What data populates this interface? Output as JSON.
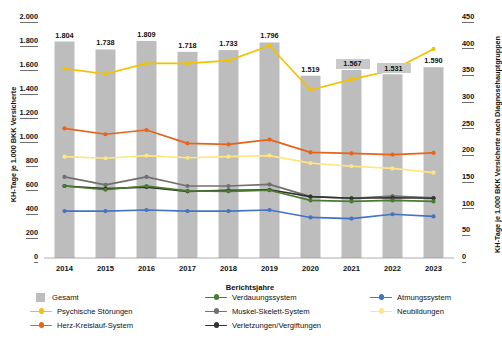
{
  "chart_data": {
    "type": "bar",
    "title": "",
    "xlabel": "Berichtsjahre",
    "ylabel": "KH-Tage je 1.000 BKK Versicherte",
    "ylabel_right": "KH-Tage je 1.000 BKK Versicherte nach Diagnosehauptgruppen",
    "categories": [
      "2014",
      "2015",
      "2016",
      "2017",
      "2018",
      "2019",
      "2020",
      "2021",
      "2022",
      "2023"
    ],
    "ylim": [
      0,
      2000
    ],
    "ylim_right": [
      0,
      450
    ],
    "yticks": [
      "0",
      "200",
      "400",
      "600",
      "800",
      "1.000",
      "1.200",
      "1.400",
      "1.600",
      "1.800",
      "2.000"
    ],
    "yticks_right": [
      "0",
      "50",
      "100",
      "150",
      "200",
      "250",
      "300",
      "350",
      "400",
      "450"
    ],
    "grid": false,
    "legend_position": "bottom",
    "bars": {
      "name": "Gesamt",
      "color": "#bdbdbd",
      "axis": "left",
      "values": [
        1804,
        1738,
        1809,
        1718,
        1733,
        1796,
        1519,
        1567,
        1531,
        1590
      ],
      "labels": [
        "1.804",
        "1.738",
        "1.809",
        "1.718",
        "1.733",
        "1.796",
        "1.519",
        "1.567",
        "1.531",
        "1.590"
      ]
    },
    "series": [
      {
        "name": "Psychische Störungen",
        "color": "#f2c200",
        "axis": "right",
        "values": [
          355,
          345,
          365,
          365,
          370,
          398,
          315,
          335,
          352,
          392
        ]
      },
      {
        "name": "Herz-Kreislauf-System",
        "color": "#e8631a",
        "axis": "right",
        "values": [
          243,
          232,
          240,
          215,
          213,
          222,
          198,
          196,
          194,
          197
        ]
      },
      {
        "name": "Neubildungen",
        "color": "#ffe680",
        "axis": "right",
        "values": [
          190,
          187,
          192,
          188,
          190,
          192,
          178,
          172,
          168,
          160
        ]
      },
      {
        "name": "Muskel-Skelett-System",
        "color": "#707070",
        "axis": "right",
        "values": [
          152,
          137,
          152,
          135,
          135,
          138,
          115,
          112,
          116,
          113
        ]
      },
      {
        "name": "Verletzungen/Vergiftungen",
        "color": "#333333",
        "axis": "right",
        "values": [
          135,
          130,
          133,
          125,
          127,
          128,
          115,
          112,
          113,
          112
        ]
      },
      {
        "name": "Verdauungssystem",
        "color": "#4a7c2f",
        "axis": "right",
        "values": [
          135,
          128,
          135,
          126,
          125,
          127,
          108,
          106,
          108,
          106
        ]
      },
      {
        "name": "Atmungssystem",
        "color": "#4472c4",
        "axis": "right",
        "values": [
          88,
          88,
          90,
          88,
          88,
          90,
          76,
          74,
          82,
          78
        ]
      }
    ]
  },
  "legend": {
    "entries": [
      {
        "label": "Gesamt",
        "color": "#bdbdbd",
        "kind": "bar"
      },
      {
        "label": "Verdauungssystem",
        "color": "#4a7c2f",
        "kind": "line"
      },
      {
        "label": "Atmungssystem",
        "color": "#4472c4",
        "kind": "line"
      },
      {
        "label": "Psychische Störungen",
        "color": "#f2c200",
        "kind": "line"
      },
      {
        "label": "Muskel-Skelett-System",
        "color": "#707070",
        "kind": "line"
      },
      {
        "label": "Neubildungen",
        "color": "#ffe680",
        "kind": "line"
      },
      {
        "label": "Herz-Kreislauf-System",
        "color": "#e8631a",
        "kind": "line"
      },
      {
        "label": "Verletzungen/Vergiftungen",
        "color": "#333333",
        "kind": "line"
      }
    ]
  }
}
